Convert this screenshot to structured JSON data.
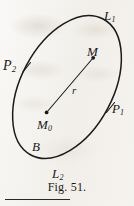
{
  "figure": {
    "caption": "Fig. 51.",
    "curve_name": "B",
    "ink_color": "#1b1a18",
    "paper_color": "#f3f1ed",
    "labels": {
      "L1": {
        "base": "L",
        "sub": "1"
      },
      "L2": {
        "base": "L",
        "sub": "2"
      },
      "P1": {
        "base": "P",
        "sub": "1"
      },
      "P2": {
        "base": "P",
        "sub": "2"
      },
      "M": {
        "base": "M",
        "sub": ""
      },
      "M0": {
        "base": "M",
        "sub": "0"
      },
      "r": {
        "base": "r",
        "sub": ""
      },
      "B": {
        "base": "B",
        "sub": ""
      }
    },
    "geometry": {
      "ellipse": {
        "center_x": 67,
        "center_y": 87,
        "radius_x": 46,
        "radius_y": 77,
        "rotation_deg": 28
      },
      "radius_segment": {
        "from_x": 47,
        "from_y": 112,
        "to_x": 93,
        "to_y": 58
      },
      "points": [
        {
          "name": "M0",
          "x": 47,
          "y": 112
        },
        {
          "name": "M",
          "x": 93,
          "y": 58
        }
      ],
      "ticks": [
        {
          "name": "P2-tick",
          "x": 26,
          "y": 68
        },
        {
          "name": "P1-tick",
          "x": 110,
          "y": 108
        }
      ]
    }
  }
}
